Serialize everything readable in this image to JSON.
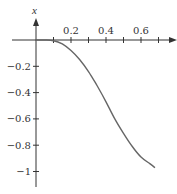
{
  "chart_data": {
    "type": "line",
    "title": "",
    "xlabel": "",
    "ylabel": "x",
    "xlim": [
      0,
      0.78
    ],
    "ylim": [
      -1.1,
      0.05
    ],
    "x_ticks": [
      0.1,
      0.2,
      0.3,
      0.4,
      0.5,
      0.6,
      0.7
    ],
    "x_tick_labels": [
      "",
      "0.2",
      "",
      "0.4",
      "",
      "0.6",
      ""
    ],
    "y_ticks": [
      -0.2,
      -0.4,
      -0.6,
      -0.8,
      -1
    ],
    "y_tick_labels": [
      "−0.2",
      "−0.4",
      "−0.6",
      "−0.8",
      "−1"
    ],
    "grid": false,
    "legend": null,
    "series": [
      {
        "name": "x",
        "color": "#666666",
        "x": [
          0.0,
          0.05,
          0.1,
          0.15,
          0.2,
          0.25,
          0.3,
          0.35,
          0.4,
          0.45,
          0.5,
          0.55,
          0.6,
          0.65,
          0.68
        ],
        "y": [
          0.0,
          0.0,
          -0.005,
          -0.03,
          -0.08,
          -0.15,
          -0.24,
          -0.35,
          -0.47,
          -0.6,
          -0.71,
          -0.81,
          -0.89,
          -0.94,
          -0.97
        ]
      }
    ]
  },
  "layout": {
    "origin_px": [
      36,
      40
    ],
    "px_per_unit_x": 175,
    "px_per_unit_y": 131.5,
    "axis_color": "#333333",
    "curve_color": "#666666"
  }
}
